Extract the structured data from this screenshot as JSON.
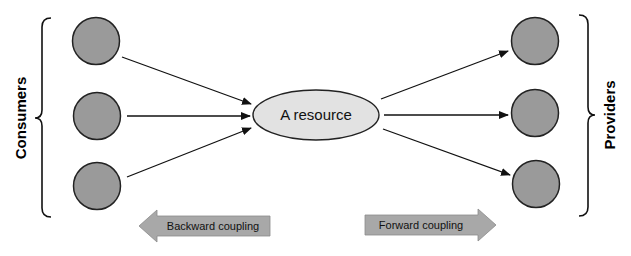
{
  "diagram": {
    "center": {
      "label": "A resource",
      "fill": "#e2e2e2"
    },
    "left_group": {
      "label": "Consumers",
      "nodes": 3
    },
    "right_group": {
      "label": "Providers",
      "nodes": 3
    },
    "node_fill": "#9a9a9a",
    "arrow_fill": "#a8a8a8",
    "big_arrows": [
      {
        "label": "Backward coupling",
        "direction": "left"
      },
      {
        "label": "Forward coupling",
        "direction": "right"
      }
    ],
    "edges": [
      {
        "from": "consumer-1",
        "to": "A resource"
      },
      {
        "from": "consumer-2",
        "to": "A resource"
      },
      {
        "from": "consumer-3",
        "to": "A resource"
      },
      {
        "from": "A resource",
        "to": "provider-1"
      },
      {
        "from": "A resource",
        "to": "provider-2"
      },
      {
        "from": "A resource",
        "to": "provider-3"
      }
    ]
  }
}
